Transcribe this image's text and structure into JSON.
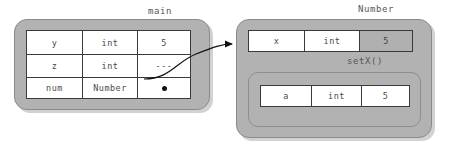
{
  "diagram": {
    "title_main": "main",
    "title_object": "Number",
    "method_label": "setX()",
    "colors": {
      "panel_gray": "#b2b2b2",
      "shadow_gray": "#d2d2d2",
      "cell_white": "#ffffff",
      "cell_highlight": "#b0b0b0",
      "border_dark": "#3a3a3a",
      "text_gray": "#4a4a4a",
      "caption_gray": "#555555",
      "arrow_black": "#111111"
    },
    "main_frame": {
      "label": "main",
      "rows": [
        {
          "name": "y",
          "type": "int",
          "value": "5",
          "kind": "value"
        },
        {
          "name": "z",
          "type": "int",
          "value": "---",
          "kind": "value"
        },
        {
          "name": "num",
          "type": "Number",
          "value": "",
          "kind": "reference"
        }
      ]
    },
    "object_frame": {
      "label": "Number",
      "rows": [
        {
          "name": "x",
          "type": "int",
          "value": "5",
          "kind": "highlight"
        }
      ],
      "method_frame": {
        "label": "setX()",
        "rows": [
          {
            "name": "a",
            "type": "int",
            "value": "5",
            "kind": "value"
          }
        ]
      }
    },
    "connector": {
      "from": "num-value-cell",
      "to": "number-object-frame",
      "style": "curved-arrow"
    }
  }
}
